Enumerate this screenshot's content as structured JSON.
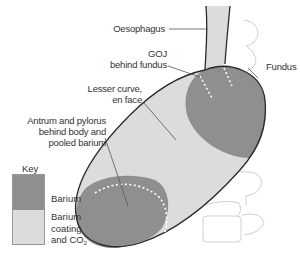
{
  "labels": {
    "oesophagus": "Oesophagus",
    "goj_line1": "GOJ",
    "goj_line2": "behind fundus",
    "fundus": "Fundus",
    "lesser_curve_line1": "Lesser curve,",
    "lesser_curve_line2": "en face",
    "antrum_line1": "Antrum and pylorus",
    "antrum_line2": "behind body and",
    "antrum_line3": "pooled barium"
  },
  "key": {
    "title": "Key",
    "items": [
      {
        "label": "Barium",
        "color": "#8f8f8f"
      },
      {
        "label_line1": "Barium",
        "label_line2": "coating",
        "label_line3": "and CO",
        "label_sub": "2",
        "color": "#dcdcdc"
      }
    ]
  },
  "colors": {
    "barium": "#8f8f8f",
    "coating": "#dcdcdc",
    "outline": "#2a2a2a",
    "spine": "#cfcfcf",
    "leader": "#555555"
  }
}
